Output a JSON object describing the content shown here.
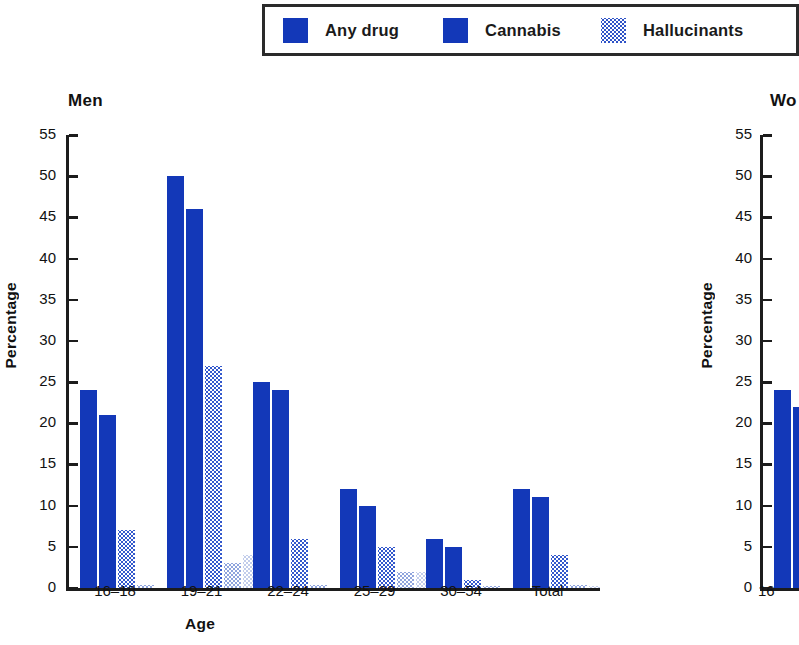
{
  "legend": {
    "items": [
      {
        "label": "Any drug",
        "swatch": "solid-blue-swatch",
        "color": "#1338b8"
      },
      {
        "label": "Cannabis",
        "swatch": "solid-blue-swatch",
        "color": "#1338b8"
      },
      {
        "label": "Hallucinants",
        "swatch": "dotted-blue-swatch",
        "color": "#2f53c8"
      }
    ]
  },
  "panels": {
    "men": {
      "title": "Men",
      "ylabel": "Percentage",
      "xlabel": "Age"
    },
    "women": {
      "title": "Wo",
      "ylabel": "Percentage",
      "xlabel": ""
    }
  },
  "chart_data": [
    {
      "type": "bar",
      "title": "Men",
      "xlabel": "Age",
      "ylabel": "Percentage",
      "ylim": [
        0,
        55
      ],
      "yticks": [
        0,
        5,
        10,
        15,
        20,
        25,
        30,
        35,
        40,
        45,
        50,
        55
      ],
      "categories": [
        "16–18",
        "19–21",
        "22–24",
        "25–29",
        "30–54",
        "Total"
      ],
      "grid": false,
      "legend_position": "top",
      "series": [
        {
          "name": "Any drug",
          "values": [
            24,
            50,
            25,
            12,
            6,
            12
          ]
        },
        {
          "name": "Cannabis",
          "values": [
            21,
            46,
            24,
            10,
            5,
            11
          ]
        },
        {
          "name": "Hallucinants",
          "values": [
            7,
            27,
            6,
            5,
            1,
            4
          ]
        },
        {
          "name": "Series 4",
          "values": [
            0.4,
            3,
            0.4,
            2,
            0.3,
            0.4
          ]
        },
        {
          "name": "Series 5",
          "values": [
            0,
            4,
            0,
            2,
            0,
            0.3
          ]
        }
      ]
    },
    {
      "type": "bar",
      "title": "Wo",
      "xlabel": "",
      "ylabel": "Percentage",
      "ylim": [
        0,
        55
      ],
      "yticks": [
        0,
        5,
        10,
        15,
        20,
        25,
        30,
        35,
        40,
        45,
        50,
        55
      ],
      "categories": [
        "16"
      ],
      "grid": false,
      "legend_position": "top",
      "series": [
        {
          "name": "Any drug",
          "values": [
            24
          ]
        },
        {
          "name": "Cannabis",
          "values": [
            22
          ]
        }
      ]
    }
  ]
}
